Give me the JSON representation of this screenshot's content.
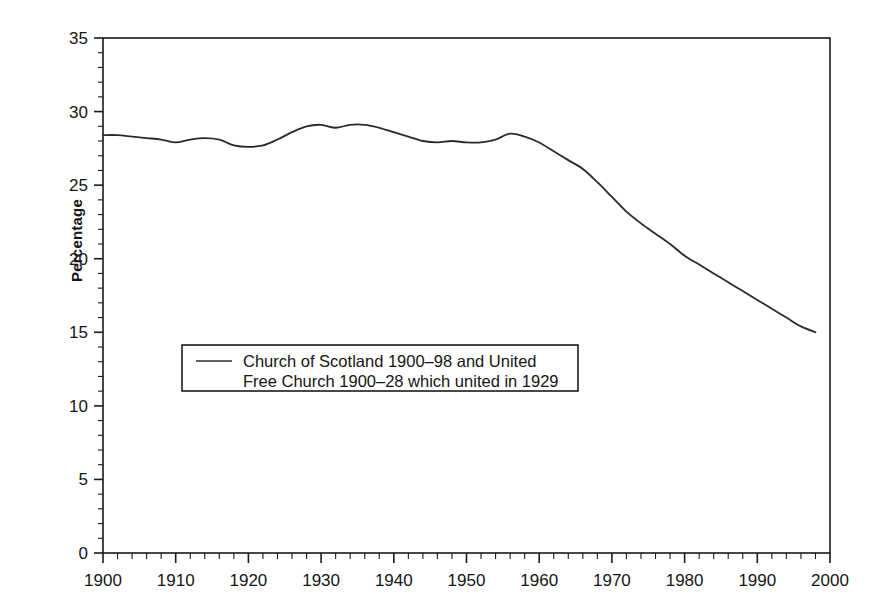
{
  "figure": {
    "background_color": "#ffffff",
    "line_color": "#2a2a2a",
    "axis_color": "#1a1a1a"
  },
  "axis": {
    "y_title": "Percentage",
    "y_ticks": [
      "0",
      "5",
      "10",
      "15",
      "20",
      "25",
      "30",
      "35"
    ],
    "x_ticks": [
      "1900",
      "1910",
      "1920",
      "1930",
      "1940",
      "1950",
      "1960",
      "1970",
      "1980",
      "1990",
      "2000"
    ]
  },
  "legend": {
    "line1": "Church of Scotland 1900–98 and United",
    "line2": "Free Church 1900–28 which united in 1929",
    "swatch": "line-swatch"
  },
  "chart_data": {
    "type": "line",
    "title": "",
    "subtitle": "",
    "xlabel": "",
    "ylabel": "Percentage",
    "xlim": [
      1900,
      2000
    ],
    "ylim": [
      0,
      35
    ],
    "x_major_step": 10,
    "x_minor_step": 2,
    "y_major_step": 5,
    "y_minor_step": 1,
    "grid": false,
    "legend_position": "inside-lower-left",
    "series": [
      {
        "name": "Church of Scotland 1900–98 and United Free Church 1900–28 which united in 1929",
        "x": [
          1900,
          1902,
          1904,
          1906,
          1908,
          1910,
          1912,
          1914,
          1916,
          1918,
          1920,
          1922,
          1924,
          1926,
          1928,
          1930,
          1932,
          1934,
          1936,
          1938,
          1940,
          1942,
          1944,
          1946,
          1948,
          1950,
          1952,
          1954,
          1956,
          1958,
          1960,
          1962,
          1964,
          1966,
          1968,
          1970,
          1972,
          1974,
          1976,
          1978,
          1980,
          1982,
          1984,
          1986,
          1988,
          1990,
          1992,
          1994,
          1996,
          1998
        ],
        "values": [
          28.4,
          28.4,
          28.3,
          28.2,
          28.1,
          27.9,
          28.1,
          28.2,
          28.1,
          27.7,
          27.6,
          27.7,
          28.1,
          28.6,
          29.0,
          29.1,
          28.9,
          29.1,
          29.1,
          28.9,
          28.6,
          28.3,
          28.0,
          27.9,
          28.0,
          27.9,
          27.9,
          28.1,
          28.5,
          28.3,
          27.9,
          27.3,
          26.7,
          26.1,
          25.2,
          24.2,
          23.2,
          22.4,
          21.7,
          21.0,
          20.2,
          19.6,
          19.0,
          18.4,
          17.8,
          17.2,
          16.6,
          16.0,
          15.4,
          15.0
        ]
      }
    ]
  }
}
